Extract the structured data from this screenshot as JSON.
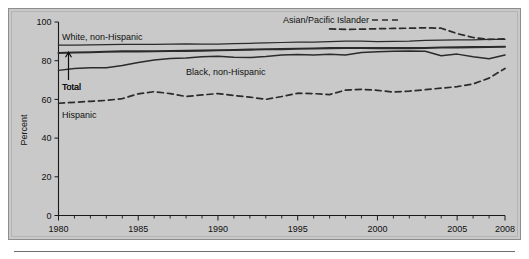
{
  "figure": {
    "background_color": "#c9c9c9",
    "page_color": "#ffffff",
    "line_color": "#2b2b2b"
  },
  "chart_data": {
    "type": "line",
    "title": "",
    "subtitle": "",
    "xlabel": "",
    "ylabel": "Percent",
    "xlim": [
      1980,
      2008
    ],
    "ylim": [
      0,
      100
    ],
    "grid": false,
    "legend_position": "inline-annotations",
    "x_ticks_major": [
      1980,
      1985,
      1990,
      1995,
      2000,
      2005,
      2008
    ],
    "x_tick_labels": [
      "1980",
      "1985",
      "1990",
      "1995",
      "2000",
      "2005",
      "2008"
    ],
    "y_ticks": [
      0,
      20,
      40,
      60,
      80,
      100
    ],
    "y_tick_labels": [
      "0",
      "20",
      "40",
      "60",
      "80",
      "100"
    ],
    "x": [
      1980,
      1981,
      1982,
      1983,
      1984,
      1985,
      1986,
      1987,
      1988,
      1989,
      1990,
      1991,
      1992,
      1993,
      1994,
      1995,
      1996,
      1997,
      1998,
      1999,
      2000,
      2001,
      2002,
      2003,
      2004,
      2005,
      2006,
      2007,
      2008
    ],
    "series": [
      {
        "name": "White, non-Hispanic",
        "style": "solid-thin",
        "label_text": "White, non-Hispanic",
        "values": [
          88.0,
          88.1,
          88.2,
          88.3,
          88.4,
          88.4,
          88.4,
          88.6,
          88.7,
          88.6,
          88.6,
          88.8,
          89.0,
          89.2,
          89.4,
          89.6,
          89.6,
          89.9,
          90.1,
          90.1,
          89.9,
          90.0,
          90.1,
          90.5,
          90.6,
          90.8,
          90.8,
          91.0,
          91.0
        ]
      },
      {
        "name": "Total",
        "style": "solid-thick",
        "label_text": "Total",
        "values": [
          84.0,
          84.2,
          84.4,
          84.6,
          84.8,
          84.8,
          84.9,
          85.0,
          85.1,
          85.2,
          85.4,
          85.5,
          85.7,
          85.9,
          86.0,
          86.2,
          86.3,
          86.5,
          86.6,
          86.6,
          86.5,
          86.6,
          86.5,
          86.6,
          86.8,
          86.9,
          87.0,
          87.1,
          87.2
        ]
      },
      {
        "name": "Black, non-Hispanic",
        "style": "solid-medium",
        "label_text": "Black, non-Hispanic",
        "values": [
          75.0,
          76.0,
          76.4,
          76.4,
          77.5,
          79.1,
          80.4,
          81.1,
          81.4,
          82.0,
          82.3,
          81.8,
          81.6,
          82.2,
          83.0,
          83.2,
          83.0,
          83.3,
          83.0,
          84.2,
          84.6,
          84.9,
          85.0,
          84.9,
          82.6,
          83.4,
          82.0,
          81.0,
          83.0
        ]
      },
      {
        "name": "Hispanic",
        "style": "dashed",
        "label_text": "Hispanic",
        "values": [
          58.0,
          58.5,
          59.0,
          59.5,
          60.4,
          62.9,
          64.0,
          63.0,
          61.5,
          62.3,
          63.0,
          62.0,
          61.2,
          60.0,
          61.5,
          63.2,
          63.0,
          62.5,
          64.8,
          65.2,
          64.7,
          63.8,
          64.3,
          65.0,
          65.8,
          66.6,
          68.0,
          71.0,
          76.0
        ]
      },
      {
        "name": "Asian/Pacific Islander",
        "style": "dashed",
        "label_text": "Asian/Pacific Islander",
        "values": [
          null,
          null,
          null,
          null,
          null,
          null,
          null,
          null,
          null,
          null,
          null,
          null,
          null,
          null,
          null,
          null,
          null,
          96.4,
          96.2,
          96.3,
          96.5,
          96.7,
          96.8,
          97.0,
          96.8,
          94.0,
          92.0,
          91.0,
          91.3
        ]
      }
    ],
    "annotations": [
      {
        "name": "total-arrow",
        "text": "Total",
        "points_to_series": "Total"
      }
    ]
  }
}
